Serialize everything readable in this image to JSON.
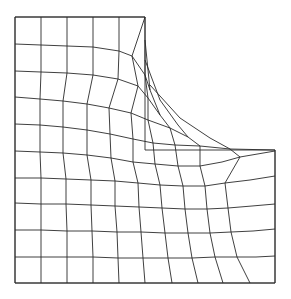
{
  "figure": {
    "type": "deformed finite-element mesh on L-shaped domain",
    "stroke_color": "#2a2a2a",
    "background": "#ffffff"
  },
  "outline": [
    [
      15,
      17
    ],
    [
      145,
      17
    ],
    [
      145,
      150
    ],
    [
      275,
      150
    ],
    [
      275,
      283
    ],
    [
      15,
      283
    ],
    [
      15,
      17
    ]
  ],
  "rows": [
    [
      [
        15,
        17
      ],
      [
        41,
        17
      ],
      [
        67,
        17
      ],
      [
        93,
        17
      ],
      [
        119,
        17
      ],
      [
        145,
        17
      ]
    ],
    [
      [
        15,
        44
      ],
      [
        41,
        45
      ],
      [
        67,
        46
      ],
      [
        93,
        47
      ],
      [
        119,
        51
      ],
      [
        132,
        56
      ],
      [
        145,
        75
      ],
      [
        150,
        90
      ]
    ],
    [
      [
        15,
        71
      ],
      [
        41,
        72
      ],
      [
        67,
        73
      ],
      [
        93,
        75
      ],
      [
        118,
        79
      ],
      [
        138,
        86
      ],
      [
        148,
        98
      ],
      [
        160,
        115
      ]
    ],
    [
      [
        15,
        97
      ],
      [
        40,
        99
      ],
      [
        63,
        101
      ],
      [
        87,
        104
      ],
      [
        109,
        108
      ],
      [
        131,
        113
      ],
      [
        148,
        120
      ],
      [
        170,
        128
      ],
      [
        188,
        137
      ]
    ],
    [
      [
        15,
        124
      ],
      [
        40,
        125
      ],
      [
        63,
        127
      ],
      [
        87,
        130
      ],
      [
        110,
        134
      ],
      [
        133,
        139
      ],
      [
        153,
        143
      ],
      [
        175,
        145
      ],
      [
        200,
        146
      ],
      [
        230,
        149
      ],
      [
        275,
        150
      ]
    ],
    [
      [
        15,
        151
      ],
      [
        40,
        152
      ],
      [
        63,
        153
      ],
      [
        87,
        155
      ],
      [
        111,
        158
      ],
      [
        133,
        162
      ],
      [
        155,
        164
      ],
      [
        178,
        166
      ],
      [
        200,
        166
      ],
      [
        222,
        162
      ],
      [
        240,
        157
      ],
      [
        275,
        151
      ]
    ],
    [
      [
        15,
        178
      ],
      [
        41,
        178
      ],
      [
        66,
        179
      ],
      [
        91,
        180
      ],
      [
        115,
        181
      ],
      [
        138,
        183
      ],
      [
        160,
        185
      ],
      [
        183,
        186
      ],
      [
        205,
        186
      ],
      [
        225,
        183
      ],
      [
        250,
        180
      ],
      [
        275,
        176
      ]
    ],
    [
      [
        15,
        203
      ],
      [
        41,
        204
      ],
      [
        66,
        204
      ],
      [
        91,
        205
      ],
      [
        115,
        206
      ],
      [
        139,
        207
      ],
      [
        162,
        208
      ],
      [
        185,
        209
      ],
      [
        207,
        209
      ],
      [
        228,
        208
      ],
      [
        252,
        206
      ],
      [
        275,
        204
      ]
    ],
    [
      [
        15,
        230
      ],
      [
        41,
        230
      ],
      [
        67,
        231
      ],
      [
        92,
        231
      ],
      [
        117,
        232
      ],
      [
        141,
        232
      ],
      [
        165,
        233
      ],
      [
        188,
        233
      ],
      [
        210,
        233
      ],
      [
        231,
        232
      ],
      [
        253,
        231
      ],
      [
        275,
        229
      ]
    ],
    [
      [
        15,
        257
      ],
      [
        41,
        257
      ],
      [
        67,
        257
      ],
      [
        93,
        257
      ],
      [
        118,
        258
      ],
      [
        143,
        258
      ],
      [
        168,
        258
      ],
      [
        192,
        258
      ],
      [
        215,
        257
      ],
      [
        237,
        257
      ],
      [
        256,
        257
      ],
      [
        275,
        256
      ]
    ],
    [
      [
        15,
        283
      ],
      [
        41,
        283
      ],
      [
        67,
        283
      ],
      [
        93,
        283
      ],
      [
        119,
        283
      ],
      [
        145,
        283
      ],
      [
        172,
        283
      ],
      [
        198,
        283
      ],
      [
        223,
        283
      ],
      [
        250,
        283
      ],
      [
        275,
        283
      ]
    ]
  ],
  "cols": [
    [
      [
        15,
        17
      ],
      [
        15,
        44
      ],
      [
        15,
        71
      ],
      [
        15,
        97
      ],
      [
        15,
        124
      ],
      [
        15,
        151
      ],
      [
        15,
        178
      ],
      [
        15,
        203
      ],
      [
        15,
        230
      ],
      [
        15,
        257
      ],
      [
        15,
        283
      ]
    ],
    [
      [
        41,
        17
      ],
      [
        41,
        45
      ],
      [
        41,
        72
      ],
      [
        40,
        99
      ],
      [
        40,
        125
      ],
      [
        40,
        152
      ],
      [
        41,
        178
      ],
      [
        41,
        204
      ],
      [
        41,
        230
      ],
      [
        41,
        257
      ],
      [
        41,
        283
      ]
    ],
    [
      [
        67,
        17
      ],
      [
        67,
        46
      ],
      [
        67,
        73
      ],
      [
        63,
        101
      ],
      [
        63,
        127
      ],
      [
        63,
        153
      ],
      [
        66,
        179
      ],
      [
        66,
        204
      ],
      [
        67,
        231
      ],
      [
        67,
        257
      ],
      [
        67,
        283
      ]
    ],
    [
      [
        93,
        17
      ],
      [
        93,
        47
      ],
      [
        93,
        75
      ],
      [
        87,
        104
      ],
      [
        87,
        130
      ],
      [
        87,
        155
      ],
      [
        91,
        180
      ],
      [
        91,
        205
      ],
      [
        92,
        231
      ],
      [
        93,
        257
      ],
      [
        93,
        283
      ]
    ],
    [
      [
        119,
        17
      ],
      [
        119,
        51
      ],
      [
        118,
        79
      ],
      [
        109,
        108
      ],
      [
        110,
        134
      ],
      [
        111,
        158
      ],
      [
        115,
        181
      ],
      [
        115,
        206
      ],
      [
        117,
        232
      ],
      [
        118,
        258
      ],
      [
        119,
        283
      ]
    ],
    [
      [
        145,
        17
      ],
      [
        132,
        56
      ],
      [
        138,
        86
      ],
      [
        131,
        113
      ],
      [
        133,
        139
      ],
      [
        133,
        162
      ],
      [
        138,
        183
      ],
      [
        139,
        207
      ],
      [
        141,
        232
      ],
      [
        143,
        258
      ],
      [
        145,
        283
      ]
    ],
    [
      [
        145,
        17
      ],
      [
        145,
        75
      ],
      [
        148,
        98
      ],
      [
        148,
        120
      ],
      [
        153,
        143
      ],
      [
        155,
        164
      ],
      [
        160,
        185
      ],
      [
        162,
        208
      ],
      [
        165,
        233
      ],
      [
        168,
        258
      ],
      [
        172,
        283
      ]
    ],
    [
      [
        145,
        40
      ],
      [
        150,
        90
      ],
      [
        160,
        115
      ],
      [
        170,
        128
      ],
      [
        175,
        145
      ],
      [
        178,
        166
      ],
      [
        183,
        186
      ],
      [
        185,
        209
      ],
      [
        188,
        233
      ],
      [
        192,
        258
      ],
      [
        198,
        283
      ]
    ],
    [
      [
        145,
        60
      ],
      [
        160,
        100
      ],
      [
        178,
        125
      ],
      [
        188,
        137
      ],
      [
        200,
        146
      ],
      [
        200,
        166
      ],
      [
        205,
        186
      ],
      [
        207,
        209
      ],
      [
        210,
        233
      ],
      [
        215,
        257
      ],
      [
        223,
        283
      ]
    ],
    [
      [
        150,
        85
      ],
      [
        180,
        118
      ],
      [
        210,
        138
      ],
      [
        230,
        149
      ],
      [
        240,
        157
      ],
      [
        225,
        183
      ],
      [
        228,
        208
      ],
      [
        231,
        232
      ],
      [
        237,
        257
      ],
      [
        250,
        283
      ]
    ],
    [
      [
        275,
        150
      ],
      [
        275,
        176
      ],
      [
        275,
        204
      ],
      [
        275,
        229
      ],
      [
        275,
        256
      ],
      [
        275,
        283
      ]
    ]
  ]
}
